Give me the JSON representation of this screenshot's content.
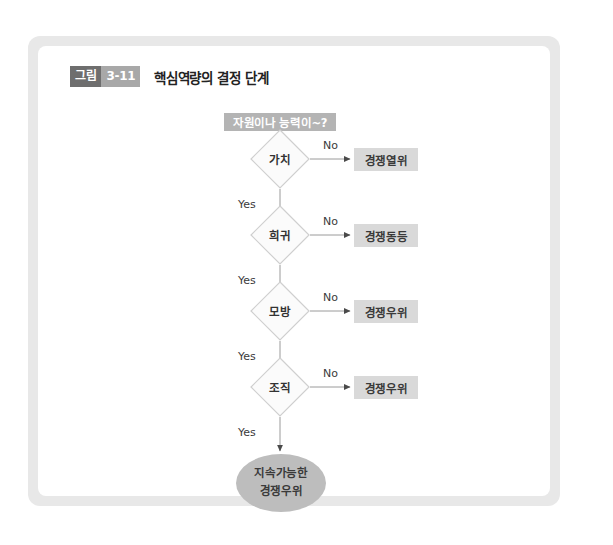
{
  "figure": {
    "caption": {
      "badge_label": "그림",
      "badge_number": "3-11",
      "title": "핵심역량의 결정 단계"
    },
    "header_node": {
      "label": "자원이나 능력이~?"
    },
    "steps": [
      {
        "decision": "가치",
        "no_label": "No",
        "yes_label": "Yes",
        "outcome": "경쟁열위"
      },
      {
        "decision": "희귀",
        "no_label": "No",
        "yes_label": "Yes",
        "outcome": "경쟁동등"
      },
      {
        "decision": "모방",
        "no_label": "No",
        "yes_label": "Yes",
        "outcome": "경쟁우위"
      },
      {
        "decision": "조직",
        "no_label": "No",
        "yes_label": "Yes",
        "outcome": "경쟁우위"
      }
    ],
    "terminal": {
      "line1": "지속가능한",
      "line2": "경쟁우위"
    },
    "colors": {
      "frame": "#e8e8e8",
      "panel": "#ffffff",
      "header_fill": "#b4b4b4",
      "diamond_fill": "#fbfbfb",
      "diamond_stroke": "#cfcfcf",
      "outcome_fill": "#d9d9d9",
      "terminal_fill": "#bdbdbd",
      "edge_stroke": "#6e6e6e",
      "badge_dark": "#6e6e6e",
      "badge_light": "#a8a8a8"
    }
  }
}
